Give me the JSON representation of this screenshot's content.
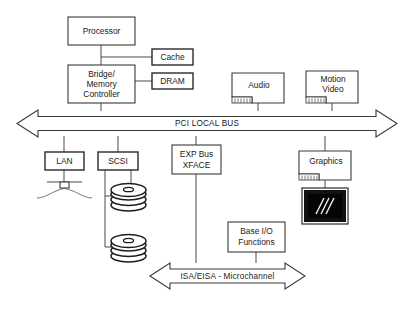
{
  "diagram": {
    "boxes": {
      "processor": "Processor",
      "cache": "Cache",
      "dram": "DRAM",
      "bridge_line1": "Bridge/",
      "bridge_line2": "Memory",
      "bridge_line3": "Controller",
      "audio": "Audio",
      "motion_line1": "Motion",
      "motion_line2": "Video",
      "lan": "LAN",
      "scsi": "SCSI",
      "exp_line1": "EXP Bus",
      "exp_line2": "XFACE",
      "graphics": "Graphics",
      "baseio_line1": "Base I/O",
      "baseio_line2": "Functions"
    },
    "buses": {
      "pci": "PCI LOCAL BUS",
      "isa": "ISA/EISA - Microchannel"
    },
    "icons": {
      "disk_top": "disk-stack-icon",
      "disk_bottom": "disk-stack-icon",
      "monitor": "crt-monitor-icon",
      "lan_transceiver": "lan-transceiver-icon",
      "audio_connector": "card-edge-connector-icon",
      "motion_connector": "card-edge-connector-icon",
      "graphics_connector": "card-edge-connector-icon"
    },
    "colors": {
      "background": "#ffffff",
      "stroke": "#3a3a3a",
      "text": "#1a1a1a",
      "screen": "#050505",
      "screen_streak": "#f2f2f2"
    }
  }
}
